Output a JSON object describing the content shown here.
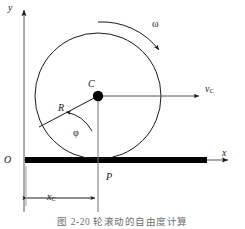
{
  "figure": {
    "caption": "图 2-20  轮滚动的自由度计算",
    "background_color": "#ffffff",
    "line_color": "#1a1a1a",
    "ground_color": "#000000"
  },
  "labels": {
    "y_axis": "y",
    "x_axis": "x",
    "origin": "O",
    "center": "C",
    "radius": "R",
    "angle": "φ",
    "angular_velocity": "ω",
    "velocity": "v",
    "velocity_subscript": "C",
    "contact_point": "P",
    "distance": "x",
    "distance_subscript": "C"
  },
  "geometry": {
    "origin": {
      "x": 24,
      "y": 160
    },
    "wheel_center": {
      "x": 98,
      "y": 96
    },
    "wheel_radius": 63,
    "contact_point": {
      "x": 98,
      "y": 160
    },
    "radius_endpoint": {
      "x": 42,
      "y": 125
    },
    "velocity_arrow_end": {
      "x": 203,
      "y": 96
    },
    "ground_bar": {
      "x1": 25,
      "x2": 207,
      "y": 160,
      "thickness": 6
    },
    "x_axis_arrow_end": {
      "x": 232,
      "y": 160
    },
    "y_axis_arrow_end": {
      "x": 24,
      "y": 8
    },
    "dimension_line_y": 198
  }
}
